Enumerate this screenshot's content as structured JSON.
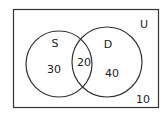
{
  "diagram": {
    "type": "venn",
    "universe_label": "U",
    "sets": [
      {
        "name": "S",
        "only_count": "30"
      },
      {
        "name": "D",
        "only_count": "40"
      }
    ],
    "intersection_count": "20",
    "outside_count": "10"
  },
  "colors": {
    "stroke": "#333333",
    "text": "#222222",
    "background": "#ffffff"
  }
}
